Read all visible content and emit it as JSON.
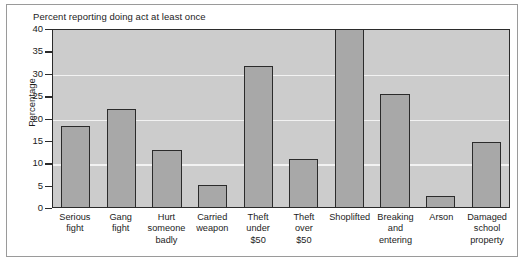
{
  "chart_data": {
    "type": "bar",
    "title": "Percent reporting doing act at least once",
    "xlabel": "",
    "ylabel": "Percentage",
    "ylim": [
      0,
      40
    ],
    "yticks": [
      0,
      5,
      10,
      15,
      20,
      25,
      30,
      35,
      40
    ],
    "gridlines": [
      10,
      20,
      30
    ],
    "grid": true,
    "legend": null,
    "categories": [
      "Serious fight",
      "Gang fight",
      "Hurt someone badly",
      "Carried weapon",
      "Theft under $50",
      "Theft over $50",
      "Shoplifted",
      "Breaking and entering",
      "Arson",
      "Damaged school property"
    ],
    "category_label_lines": [
      [
        "Serious",
        "fight"
      ],
      [
        "Gang",
        "fight"
      ],
      [
        "Hurt",
        "someone",
        "badly"
      ],
      [
        "Carried",
        "weapon"
      ],
      [
        "Theft",
        "under",
        "$50"
      ],
      [
        "Theft",
        "over",
        "$50"
      ],
      [
        "Shoplifted"
      ],
      [
        "Breaking",
        "and",
        "entering"
      ],
      [
        "Arson"
      ],
      [
        "Damaged",
        "school",
        "property"
      ]
    ],
    "values": [
      18.0,
      21.9,
      12.8,
      4.9,
      31.5,
      10.7,
      40.0,
      25.2,
      2.5,
      14.5
    ],
    "colors": {
      "bar_fill": "#a8a8a8",
      "bar_stroke": "#2b2b2b",
      "plot_background": "#cccccc",
      "gridline": "#f2f2f2",
      "axis": "#2b2b2b",
      "text": "#1c1c1c",
      "frame": "#9a9a9a",
      "page_background": "#ffffff"
    }
  }
}
